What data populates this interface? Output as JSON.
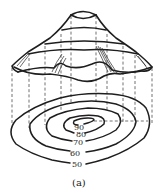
{
  "figure": {
    "caption": "(a)",
    "contour_labels": [
      "90",
      "80",
      "70",
      "60",
      "50"
    ],
    "line_color": "#1e1e1e",
    "background": "#ffffff"
  }
}
